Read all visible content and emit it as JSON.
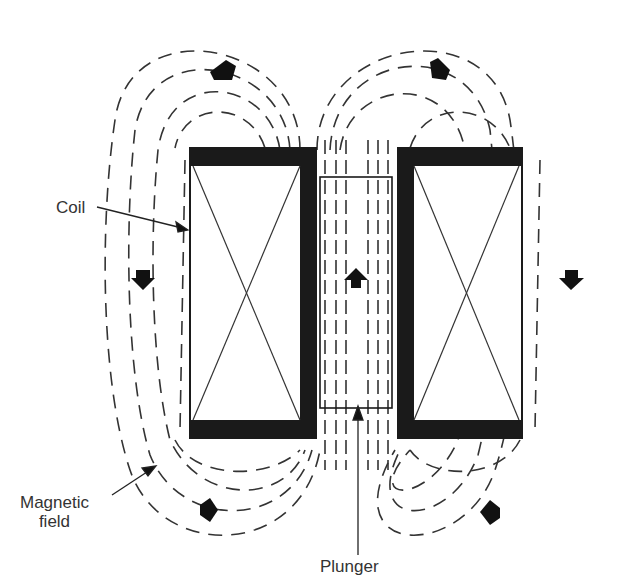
{
  "diagram": {
    "labels": {
      "coil": "Coil",
      "magnetic_field_line1": "Magnetic",
      "magnetic_field_line2": "field",
      "plunger": "Plunger"
    },
    "components": {
      "left_coil": {
        "x": 190,
        "y": 148,
        "w": 126,
        "h": 290
      },
      "right_coil": {
        "x": 398,
        "y": 148,
        "w": 124,
        "h": 290
      },
      "plunger": {
        "x": 320,
        "y": 177,
        "w": 72,
        "h": 231
      }
    },
    "flow_arrows": [
      {
        "id": "top-left",
        "direction": "up-left"
      },
      {
        "id": "top-right",
        "direction": "up-right"
      },
      {
        "id": "center",
        "direction": "up"
      },
      {
        "id": "left-side",
        "direction": "down"
      },
      {
        "id": "right-side",
        "direction": "down"
      },
      {
        "id": "bottom-left",
        "direction": "right"
      },
      {
        "id": "bottom-right",
        "direction": "left"
      }
    ],
    "colors": {
      "ink": "#1a1a1a",
      "background": "#ffffff"
    }
  }
}
